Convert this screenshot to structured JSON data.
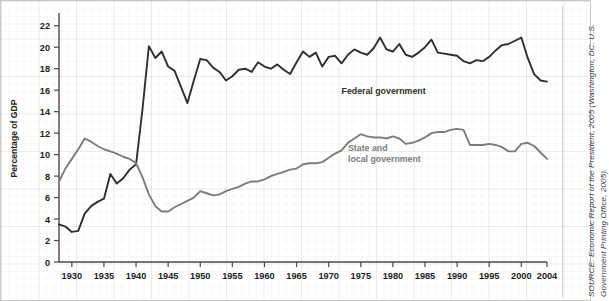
{
  "figure": {
    "source_note": "SOURCE: Economic Report of the President, 2005 (Washington, DC: U.S. Government Printing Office, 2005).",
    "background_color": "#ffffff",
    "border_color": "#c9c9c9"
  },
  "chart_data": {
    "type": "line",
    "title": "",
    "subtitle": "",
    "xlabel": "",
    "ylabel": "Percentage of GDP",
    "xlim": [
      1928,
      2004
    ],
    "ylim": [
      0,
      23
    ],
    "grid": true,
    "grid_style": "graph-paper",
    "legend_position": "inline-annotation",
    "y_ticks": [
      0,
      2,
      4,
      6,
      8,
      10,
      12,
      14,
      16,
      18,
      20,
      22
    ],
    "x_ticks": [
      1930,
      1935,
      1940,
      1945,
      1950,
      1955,
      1960,
      1965,
      1970,
      1975,
      1980,
      1985,
      1990,
      1995,
      2000,
      2004
    ],
    "x_tick_labels": [
      "1930",
      "1935",
      "1940",
      "1945",
      "1950",
      "1955",
      "1960",
      "1965",
      "1970",
      "1975",
      "1980",
      "1985",
      "1990",
      "1995",
      "2000",
      "2004"
    ],
    "y_tick_labels": [
      "0",
      "2",
      "4",
      "6",
      "8",
      "10",
      "12",
      "14",
      "16",
      "18",
      "20",
      "22"
    ],
    "x": [
      1928,
      1929,
      1930,
      1931,
      1932,
      1933,
      1934,
      1935,
      1936,
      1937,
      1938,
      1939,
      1940,
      1941,
      1942,
      1943,
      1944,
      1945,
      1946,
      1947,
      1948,
      1949,
      1950,
      1951,
      1952,
      1953,
      1954,
      1955,
      1956,
      1957,
      1958,
      1959,
      1960,
      1961,
      1962,
      1963,
      1964,
      1965,
      1966,
      1967,
      1968,
      1969,
      1970,
      1971,
      1972,
      1973,
      1974,
      1975,
      1976,
      1977,
      1978,
      1979,
      1980,
      1981,
      1982,
      1983,
      1984,
      1985,
      1986,
      1987,
      1988,
      1989,
      1990,
      1991,
      1992,
      1993,
      1994,
      1995,
      1996,
      1997,
      1998,
      1999,
      2000,
      2001,
      2002,
      2003,
      2004
    ],
    "series": [
      {
        "name": "Federal government",
        "color": "#2f2f2f",
        "label_x": 1972,
        "label_y": 15.6,
        "values": [
          3.5,
          3.3,
          2.8,
          2.9,
          4.5,
          5.2,
          5.6,
          5.9,
          8.2,
          7.3,
          7.8,
          8.6,
          9.1,
          14.2,
          20.1,
          19.0,
          19.6,
          18.2,
          17.8,
          16.3,
          14.8,
          16.9,
          18.9,
          18.8,
          18.1,
          17.7,
          16.9,
          17.3,
          17.9,
          18.0,
          17.7,
          18.6,
          18.2,
          18.0,
          18.4,
          17.9,
          17.5,
          18.6,
          19.6,
          19.1,
          19.5,
          18.2,
          19.1,
          19.2,
          18.5,
          19.3,
          19.8,
          19.5,
          19.3,
          19.9,
          20.9,
          19.8,
          19.6,
          20.3,
          19.3,
          19.1,
          19.5,
          20.0,
          20.7,
          19.5,
          19.4,
          19.3,
          19.2,
          18.7,
          18.5,
          18.8,
          18.7,
          19.1,
          19.7,
          20.2,
          20.3,
          20.6,
          20.9,
          19.0,
          17.5,
          16.9,
          16.8
        ]
      },
      {
        "name": "State and local government",
        "color": "#7c7c7c",
        "label_x": 1973,
        "label_y": 10.3,
        "values": [
          7.5,
          8.7,
          9.6,
          10.5,
          11.5,
          11.2,
          10.8,
          10.5,
          10.3,
          10.1,
          9.8,
          9.6,
          9.2,
          7.9,
          6.3,
          5.2,
          4.7,
          4.7,
          5.1,
          5.4,
          5.7,
          6.0,
          6.6,
          6.4,
          6.2,
          6.3,
          6.6,
          6.8,
          7.0,
          7.3,
          7.5,
          7.5,
          7.7,
          8.0,
          8.2,
          8.4,
          8.6,
          8.7,
          9.1,
          9.2,
          9.2,
          9.3,
          9.7,
          10.1,
          10.4,
          11.1,
          11.5,
          11.9,
          11.7,
          11.6,
          11.6,
          11.5,
          11.7,
          11.5,
          11.0,
          11.1,
          11.3,
          11.6,
          12.0,
          12.1,
          12.1,
          12.3,
          12.4,
          12.3,
          10.9,
          10.9,
          10.9,
          11.0,
          10.9,
          10.7,
          10.3,
          10.3,
          11.0,
          11.1,
          10.8,
          10.2,
          9.6
        ]
      }
    ],
    "annotations": [
      {
        "text": "Federal government",
        "x": 1972,
        "y": 15.6,
        "color": "#2f2f2f"
      },
      {
        "text": "State and\nlocal government",
        "x": 1973,
        "y": 10.3,
        "color": "#7c7c7c"
      }
    ]
  }
}
